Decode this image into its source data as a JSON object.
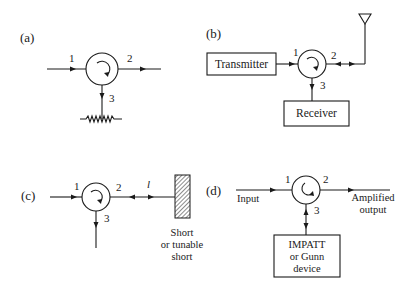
{
  "diagram": {
    "panels": [
      {
        "id": "a",
        "label": "(a)",
        "ports": [
          "1",
          "2",
          "3"
        ],
        "termination": "matched-load-resistor"
      },
      {
        "id": "b",
        "label": "(b)",
        "ports": [
          "1",
          "2",
          "3"
        ],
        "blocks": {
          "transmitter": "Transmitter",
          "receiver": "Receiver"
        },
        "termination": "antenna"
      },
      {
        "id": "c",
        "label": "(c)",
        "ports": [
          "1",
          "2",
          "3"
        ],
        "length_symbol": "l",
        "short_label": [
          "Short",
          "or tunable",
          "short"
        ]
      },
      {
        "id": "d",
        "label": "(d)",
        "ports": [
          "1",
          "2",
          "3"
        ],
        "input_label": "Input",
        "output_label": [
          "Amplified",
          "output"
        ],
        "device_label": [
          "IMPATT",
          "or Gunn",
          "device"
        ]
      }
    ],
    "colors": {
      "ink": "#1a1a1a",
      "background": "#ffffff"
    }
  }
}
